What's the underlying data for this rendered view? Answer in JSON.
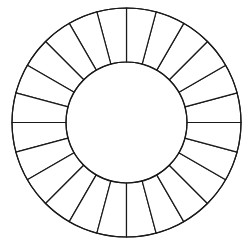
{
  "diagram": {
    "type": "segmented-ring",
    "canvas": {
      "width": 247,
      "height": 250,
      "background": "#ffffff"
    },
    "center": {
      "x": 126.5,
      "y": 122.5
    },
    "outer_radius": 114.5,
    "inner_radius": 60.5,
    "segment_count": 24,
    "segment_angle_deg": 15,
    "start_angle_deg": 0,
    "stroke_color": "#1a1a1a",
    "stroke_width": 1.2,
    "fill_color": "#ffffff",
    "segments": [
      {
        "index": 0,
        "label": ""
      },
      {
        "index": 1,
        "label": ""
      },
      {
        "index": 2,
        "label": ""
      },
      {
        "index": 3,
        "label": ""
      },
      {
        "index": 4,
        "label": ""
      },
      {
        "index": 5,
        "label": ""
      },
      {
        "index": 6,
        "label": ""
      },
      {
        "index": 7,
        "label": ""
      },
      {
        "index": 8,
        "label": ""
      },
      {
        "index": 9,
        "label": ""
      },
      {
        "index": 10,
        "label": ""
      },
      {
        "index": 11,
        "label": ""
      },
      {
        "index": 12,
        "label": ""
      },
      {
        "index": 13,
        "label": ""
      },
      {
        "index": 14,
        "label": ""
      },
      {
        "index": 15,
        "label": ""
      },
      {
        "index": 16,
        "label": ""
      },
      {
        "index": 17,
        "label": ""
      },
      {
        "index": 18,
        "label": ""
      },
      {
        "index": 19,
        "label": ""
      },
      {
        "index": 20,
        "label": ""
      },
      {
        "index": 21,
        "label": ""
      },
      {
        "index": 22,
        "label": ""
      },
      {
        "index": 23,
        "label": ""
      }
    ]
  }
}
